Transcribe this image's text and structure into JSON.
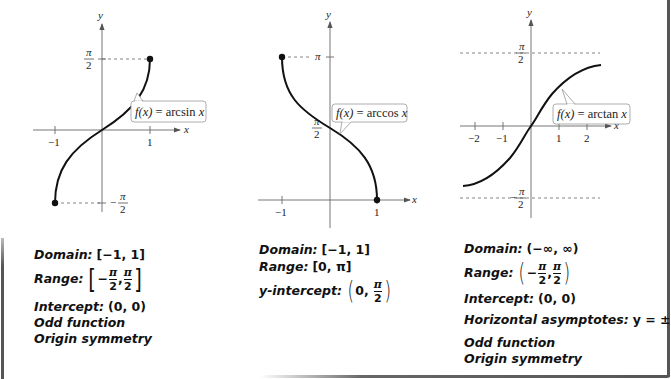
{
  "panels": [
    {
      "id": "arcsin",
      "function_label": "f(x) = arcsin x",
      "function_label_parts": {
        "f": "f(x)",
        "eq": " = arcsin ",
        "x": "x"
      },
      "axis_labels": {
        "x": "x",
        "y": "y"
      },
      "x_ticks": [
        "−1",
        "1"
      ],
      "y_ticks": [
        {
          "num": "π",
          "den": "2",
          "sign": ""
        },
        {
          "num": "π",
          "den": "2",
          "sign": "−"
        }
      ],
      "properties": {
        "domain_label": "Domain:",
        "domain_value": "[−1, 1]",
        "range_label": "Range:",
        "range_open": "[",
        "range_close": "]",
        "range_lo": {
          "sign": "−",
          "num": "π",
          "den": "2"
        },
        "range_hi": {
          "num": "π",
          "den": "2"
        },
        "intercept_label": "Intercept:",
        "intercept_value": "(0, 0)",
        "parity": "Odd function",
        "symmetry": "Origin symmetry"
      }
    },
    {
      "id": "arccos",
      "function_label": "f(x) = arccos x",
      "function_label_parts": {
        "f": "f(x)",
        "eq": " = arccos ",
        "x": "x"
      },
      "axis_labels": {
        "x": "x",
        "y": "y"
      },
      "x_ticks": [
        "−1",
        "1"
      ],
      "y_ticks": [
        {
          "num": "π",
          "den": "",
          "sign": ""
        },
        {
          "num": "π",
          "den": "2",
          "sign": ""
        }
      ],
      "properties": {
        "domain_label": "Domain:",
        "domain_value": "[−1, 1]",
        "range_label": "Range:",
        "range_value": "[0, π]",
        "intercept_label": "y-intercept:",
        "intercept_open": "(",
        "intercept_close": ")",
        "intercept_x": "0,",
        "intercept_y": {
          "num": "π",
          "den": "2"
        }
      }
    },
    {
      "id": "arctan",
      "function_label": "f(x) = arctan x",
      "function_label_parts": {
        "f": "f(x)",
        "eq": " = arctan ",
        "x": "x"
      },
      "axis_labels": {
        "x": "x",
        "y": "y"
      },
      "x_ticks": [
        "−2",
        "−1",
        "1",
        "2"
      ],
      "y_ticks": [
        {
          "num": "π",
          "den": "2",
          "sign": ""
        },
        {
          "num": "π",
          "den": "2",
          "sign": "−"
        }
      ],
      "properties": {
        "domain_label": "Domain:",
        "domain_value": "(−∞, ∞)",
        "range_label": "Range:",
        "range_open": "(",
        "range_close": ")",
        "range_lo": {
          "sign": "−",
          "num": "π",
          "den": "2"
        },
        "range_hi": {
          "num": "π",
          "den": "2"
        },
        "intercept_label": "Intercept:",
        "intercept_value": "(0, 0)",
        "asymptote_label": "Horizontal asymptotes:",
        "asymptote_value": "y = ±",
        "asymptote_frac": {
          "num": "π",
          "den": "2"
        },
        "parity": "Odd function",
        "symmetry": "Origin symmetry"
      }
    }
  ],
  "colors": {
    "curve": "#111111",
    "axis": "#555555",
    "dashed": "#666666",
    "frame": "#555555",
    "label_box": "#888888"
  }
}
